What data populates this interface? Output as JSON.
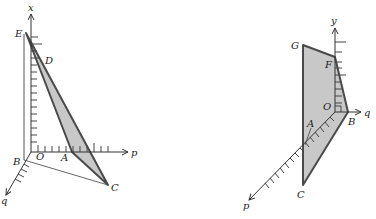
{
  "colors": {
    "background": "#ffffff",
    "fill": "#c8c8c8",
    "outline": "#4a4a4a",
    "axis": "#333333"
  },
  "left_diagram": {
    "axis_labels": {
      "vertical": "x",
      "horizontal": "p",
      "oblique": "q"
    },
    "origin_label": "O",
    "points": [
      {
        "name": "E",
        "x": 26,
        "y": 33
      },
      {
        "name": "D",
        "x": 38,
        "y": 58
      },
      {
        "name": "A",
        "x": 72,
        "y": 152
      },
      {
        "name": "C",
        "x": 108,
        "y": 185
      },
      {
        "name": "B",
        "x": 24,
        "y": 160
      }
    ],
    "shaded_polygon": [
      "E",
      "D",
      "A",
      "C"
    ]
  },
  "right_diagram": {
    "axis_labels": {
      "vertical": "y",
      "horizontal": "q",
      "oblique": "p"
    },
    "origin_label": "O",
    "points": [
      {
        "name": "G",
        "x": 303,
        "y": 45
      },
      {
        "name": "F",
        "x": 335,
        "y": 57
      },
      {
        "name": "B",
        "x": 348,
        "y": 112
      },
      {
        "name": "A",
        "x": 305,
        "y": 135
      },
      {
        "name": "C",
        "x": 303,
        "y": 185
      }
    ],
    "shaded_polygon": [
      "G",
      "F",
      "B",
      "C"
    ]
  }
}
